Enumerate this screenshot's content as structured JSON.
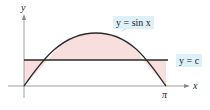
{
  "figure": {
    "axis_x_label": "x",
    "axis_y_label": "y",
    "tick_pi_label": "π",
    "curve_label": "y = sin x",
    "line_label": "y = c",
    "colors": {
      "curve": "#2a2a2a",
      "shading": "#f9dede",
      "axes": "#888888",
      "label_bg": "#dff1f8"
    }
  }
}
